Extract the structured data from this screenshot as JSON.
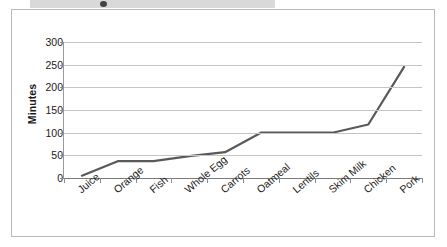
{
  "page": {
    "cutoff_text": "",
    "background_color": "#ffffff",
    "border_color": "#b9b9b9"
  },
  "chart_data": {
    "type": "line",
    "title": "",
    "xlabel": "",
    "ylabel": "Minutes",
    "categories": [
      "Juice",
      "Orange",
      "Fish",
      "Whole Egg",
      "Carrots",
      "Oatmeal",
      "Lentils",
      "Skim Milk",
      "Chicken",
      "Pork"
    ],
    "values": [
      5,
      37,
      37,
      48,
      57,
      100,
      100,
      100,
      118,
      245
    ],
    "ylim": [
      0,
      300
    ],
    "ytick_labels": [
      "0",
      "50",
      "100",
      "150",
      "200",
      "250",
      "300"
    ],
    "ytick_values": [
      0,
      50,
      100,
      150,
      200,
      250,
      300
    ],
    "grid": true,
    "legend": "none",
    "series_color": "#595959",
    "grid_color": "#c4c4c4",
    "axis_color": "#8c8c8c"
  }
}
